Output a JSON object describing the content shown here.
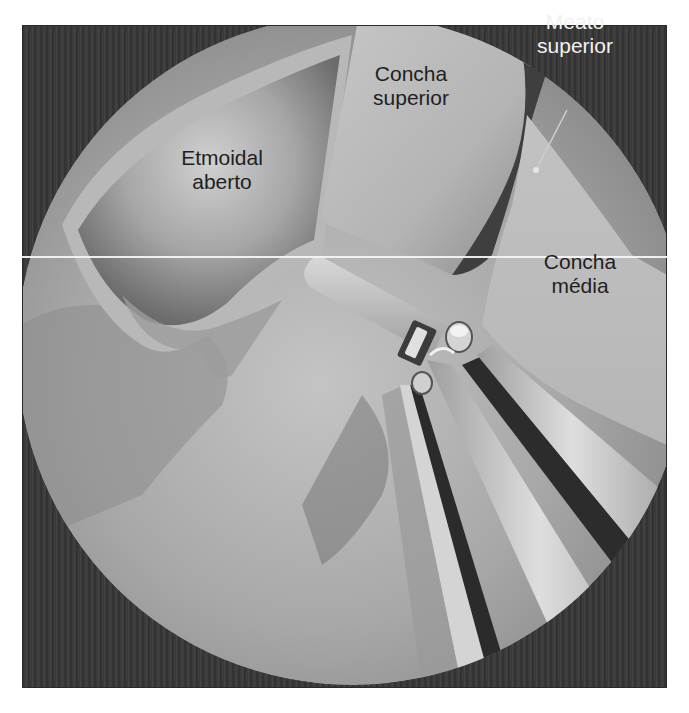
{
  "figure": {
    "type": "endoscopic-illustration",
    "style": "grayscale",
    "colors": {
      "background_dark": "#3a3a3a",
      "tissue_light": "#c8c8c8",
      "tissue_mid": "#9a9a9a",
      "tissue_dark": "#6e6e6e",
      "instrument_light": "#d9d9d9",
      "instrument_dark": "#2a2a2a",
      "label_dark": "#1f1f1f",
      "label_light": "#f2f2f2"
    }
  },
  "labels": {
    "meato_superior": {
      "line1": "Meato",
      "line2": "superior"
    },
    "concha_superior": {
      "line1": "Concha",
      "line2": "superior"
    },
    "etmoidal_aberto": {
      "line1": "Etmoidal",
      "line2": "aberto"
    },
    "concha_media": {
      "line1": "Concha",
      "line2": "média"
    }
  },
  "caption": {
    "text": ""
  }
}
